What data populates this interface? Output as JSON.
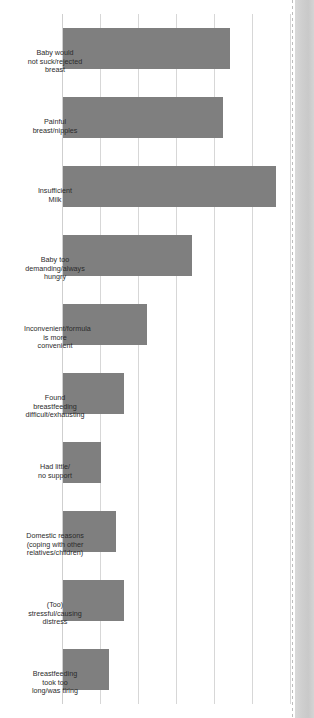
{
  "figure": {
    "orientation": "rotated-90",
    "bar_color": "#7f7f7f",
    "grid_color": "#d7d7d7",
    "background": "#ffffff",
    "gutter_color": "#d4d4d4"
  },
  "chart_data": {
    "type": "bar",
    "title": "",
    "subtitle": "",
    "xlabel": "",
    "ylabel": "",
    "ylim": [
      0,
      30
    ],
    "grid": true,
    "legend": "none",
    "orientation": "vertical-bars-on-rotated-page",
    "tick_labels": [
      "0",
      "5",
      "10",
      "15",
      "20",
      "25",
      "30"
    ],
    "tick_values": [
      0,
      5,
      10,
      15,
      20,
      25,
      30
    ],
    "categories": [
      "Baby would\nnot suck/rejected\nbreast",
      "Painful\nbreast/nipples",
      "Insufficient\nMilk",
      "Baby too\ndemanding/always\nhungry",
      "Inconvenient/formula\nis more\nconvenient",
      "Found\nbreastfeeding\ndifficult/exhausting",
      "Had little/\nno support",
      "Domestic reasons\n(coping with other\nrelatives/children)",
      "(Too)\nstressful/causing\ndistress",
      "Breastfeeding\ntook too\nlong/was tiring"
    ],
    "values": [
      22,
      21,
      28,
      17,
      11,
      8,
      5,
      7,
      8,
      6
    ]
  }
}
